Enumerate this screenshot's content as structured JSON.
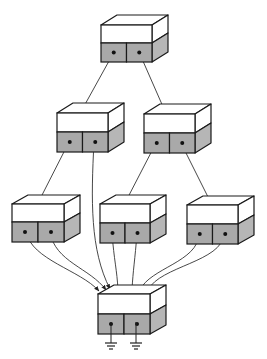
{
  "diagram": {
    "type": "tree-network",
    "colors": {
      "background": "#ffffff",
      "stroke": "#1a1a1a",
      "box_top": "#ffffff",
      "box_front_upper": "#ffffff",
      "box_front_lower": "#a9a9a9",
      "box_side_upper": "#ffffff",
      "box_side_lower": "#b6b6b6",
      "wire": "#333333"
    },
    "boxes": [
      {
        "id": "root",
        "x": 101,
        "y": 25,
        "w": 51,
        "hu": 18,
        "hl": 19,
        "dx": 16,
        "dy": 10
      },
      {
        "id": "mid-left",
        "x": 57,
        "y": 113,
        "w": 51,
        "hu": 19,
        "hl": 20,
        "dx": 16,
        "dy": 10
      },
      {
        "id": "mid-right",
        "x": 144,
        "y": 114,
        "w": 51,
        "hu": 19,
        "hl": 20,
        "dx": 16,
        "dy": 10
      },
      {
        "id": "low-left",
        "x": 12,
        "y": 204,
        "w": 52,
        "hu": 18,
        "hl": 20,
        "dx": 16,
        "dy": 9
      },
      {
        "id": "low-middle",
        "x": 100,
        "y": 204,
        "w": 50,
        "hu": 19,
        "hl": 20,
        "dx": 16,
        "dy": 9
      },
      {
        "id": "low-right",
        "x": 187,
        "y": 205,
        "w": 51,
        "hu": 19,
        "hl": 20,
        "dx": 16,
        "dy": 9
      },
      {
        "id": "ground-box",
        "x": 98,
        "y": 294,
        "w": 52,
        "hu": 20,
        "hl": 20,
        "dx": 16,
        "dy": 9
      }
    ],
    "edges": [
      {
        "from": "root.left",
        "to": "mid-left",
        "path": "M114,52 L83,108"
      },
      {
        "from": "root.right",
        "to": "mid-right",
        "path": "M139,52 L164,109"
      },
      {
        "from": "mid-left.left",
        "to": "low-left",
        "path": "M69,142 L39,201"
      },
      {
        "from": "mid-right.left",
        "to": "low-middle",
        "path": "M156,143 L126,201"
      },
      {
        "from": "mid-right.right",
        "to": "low-right",
        "path": "M181,143 L211,203"
      },
      {
        "from": "mid-left.right",
        "to": "ground-box",
        "path": "M94,142 C91,200 90,250 110,289"
      },
      {
        "from": "low-left.left",
        "to": "ground-box",
        "path": "M26,232 C32,260 80,270 99,291"
      },
      {
        "from": "low-left.right",
        "to": "ground-box",
        "path": "M50,232 C55,262 90,268 106,290"
      },
      {
        "from": "low-middle.left",
        "to": "ground-box",
        "path": "M112,233 C114,260 117,270 118,290"
      },
      {
        "from": "low-middle.right",
        "to": "ground-box",
        "path": "M137,233 C135,260 133,270 132,290"
      },
      {
        "from": "low-right.left",
        "to": "ground-box",
        "path": "M199,234 C198,262 150,268 140,290"
      },
      {
        "from": "low-right.right",
        "to": "ground-box",
        "path": "M224,234 C222,262 160,266 148,290"
      }
    ],
    "grounds": [
      {
        "x": 111,
        "y": 322
      },
      {
        "x": 136,
        "y": 322
      }
    ]
  }
}
